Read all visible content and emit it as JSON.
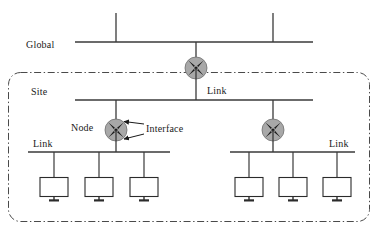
{
  "diagram": {
    "labels": {
      "global": "Global",
      "site": "Site",
      "link_site": "Link",
      "link_left": "Link",
      "link_right": "Link",
      "node": "Node",
      "interface": "Interface"
    },
    "icons": {
      "global_node": "node-icon",
      "site_node_left": "node-icon",
      "site_node_right": "node-icon",
      "host": "computer-monitor-icon"
    },
    "colors": {
      "node_fill": "#a8a8a8",
      "node_stroke": "#4d4d4d",
      "line": "#3a3a3a",
      "boundary": "#4a4a4a",
      "background": "#ffffff",
      "text": "#1a1a1a"
    },
    "counts": {
      "global_node_count": 1,
      "site_node_count": 2,
      "host_count": 6,
      "link_count": 3,
      "interface_arrow_count": 2
    },
    "geometry": {
      "global_bus_y": 42,
      "site_bus_y": 100,
      "lower_bus_y": 152,
      "site_boundary": "8,72 370,222"
    }
  }
}
